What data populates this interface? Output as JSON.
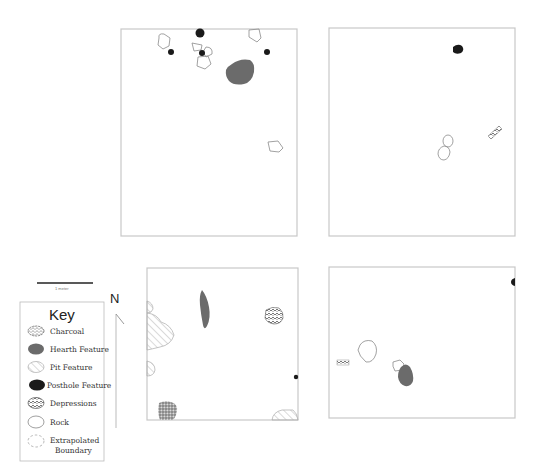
{
  "diagram": {
    "type": "archaeological excavation unit plan",
    "units": [
      {
        "id": "unit-nw",
        "box": [
          121,
          29,
          297,
          236
        ]
      },
      {
        "id": "unit-ne",
        "box": [
          329,
          28,
          515,
          236
        ]
      },
      {
        "id": "unit-sw",
        "box": [
          147,
          268,
          298,
          420
        ]
      },
      {
        "id": "unit-se",
        "box": [
          329,
          267,
          515,
          418
        ]
      }
    ]
  },
  "scale_bar": {
    "label": "1 meter"
  },
  "north_arrow": {
    "label": "N"
  },
  "key": {
    "title": "Key",
    "items": [
      {
        "symbol": "charcoal",
        "label": "Charcoal"
      },
      {
        "symbol": "hearth",
        "label": "Hearth Feature"
      },
      {
        "symbol": "pit",
        "label": "Pit Feature"
      },
      {
        "symbol": "posthole",
        "label": "Posthole Feature"
      },
      {
        "symbol": "depression",
        "label": "Depressions"
      },
      {
        "symbol": "rock",
        "label": "Rock"
      },
      {
        "symbol": "extrapolated",
        "label": "Extrapolated",
        "label2": "Boundary"
      }
    ]
  },
  "colors": {
    "unit_border": "#c8c8c8",
    "hearth": "#6b6b6b",
    "posthole": "#1a1a1a",
    "rock_outline": "#8a8a8a",
    "pit_hatch": "#b0b0b0",
    "depression": "#555555"
  }
}
